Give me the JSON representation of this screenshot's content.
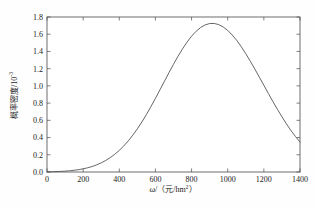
{
  "figure": {
    "name": "probability-density-plot",
    "background_color": "#fefefe",
    "curve_color": "#555555",
    "axis_color": "#4a4a4a"
  },
  "labels": {
    "y_axis_title_main": "概率密度/10",
    "y_axis_title_exponent": "-3",
    "x_axis_title_symbol": "ω",
    "x_axis_title_rest": "/（元/hm",
    "x_axis_title_exponent": "2",
    "x_axis_title_close": "）"
  },
  "chart_data": {
    "type": "line",
    "title": "",
    "subtitle": "",
    "xlabel": "ω/（元/hm²）",
    "ylabel": "概率密度/10⁻³",
    "xlim": [
      0,
      1400
    ],
    "ylim": [
      0.0,
      1.8
    ],
    "grid": false,
    "legend": null,
    "legend_position": "none",
    "xticks": [
      0,
      200,
      400,
      600,
      800,
      1000,
      1200,
      1400
    ],
    "xtick_labels": [
      "0",
      "200",
      "400",
      "600",
      "800",
      "1000",
      "1200",
      "1400"
    ],
    "yticks": [
      0.0,
      0.2,
      0.4,
      0.6,
      0.8,
      1.0,
      1.2,
      1.4,
      1.6,
      1.8
    ],
    "ytick_labels": [
      "0.0",
      "0.2",
      "0.4",
      "0.6",
      "0.8",
      "1.0",
      "1.2",
      "1.4",
      "1.6",
      "1.8"
    ],
    "annotations": [],
    "series": [
      {
        "name": "probability density",
        "color": "#555555",
        "line_width": 0.9,
        "peak_x": 860,
        "peak_y": 1.77,
        "x": [
          0,
          25,
          50,
          75,
          100,
          125,
          150,
          175,
          200,
          225,
          250,
          275,
          300,
          325,
          350,
          375,
          400,
          425,
          450,
          475,
          500,
          525,
          550,
          575,
          600,
          625,
          650,
          675,
          700,
          725,
          750,
          775,
          800,
          825,
          850,
          875,
          900,
          925,
          950,
          975,
          1000,
          1025,
          1050,
          1075,
          1100,
          1125,
          1150,
          1175,
          1200,
          1225,
          1250,
          1275,
          1300,
          1325,
          1350,
          1375,
          1400
        ],
        "y": [
          0.002,
          0.003,
          0.005,
          0.007,
          0.01,
          0.014,
          0.02,
          0.027,
          0.037,
          0.049,
          0.064,
          0.083,
          0.106,
          0.134,
          0.167,
          0.206,
          0.251,
          0.303,
          0.362,
          0.428,
          0.501,
          0.581,
          0.667,
          0.759,
          0.855,
          0.954,
          1.054,
          1.154,
          1.251,
          1.344,
          1.43,
          1.508,
          1.577,
          1.634,
          1.678,
          1.708,
          1.724,
          1.725,
          1.712,
          1.684,
          1.644,
          1.591,
          1.528,
          1.455,
          1.374,
          1.287,
          1.196,
          1.102,
          1.007,
          0.912,
          0.818,
          0.728,
          0.641,
          0.559,
          0.482,
          0.412,
          0.348
        ]
      }
    ]
  }
}
